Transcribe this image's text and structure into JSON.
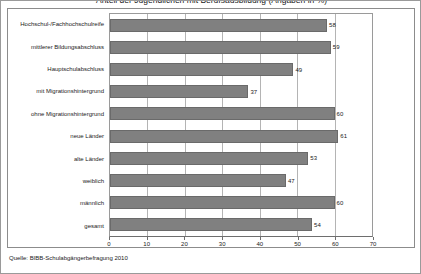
{
  "title": "Anteil der Jugendlichen mit Berufsausbildung (Angaben in %)",
  "source_note": "Quelle: BIBB-Schulabgängerbefragung 2010",
  "colors": {
    "bar_fill": "#808080",
    "bar_border": "#6a6a6a",
    "gridline": "#b4b4b4",
    "frame": "#8c8c8c",
    "background": "#ffffff",
    "text": "#1a1a1a"
  },
  "chart_data": {
    "type": "bar",
    "orientation": "horizontal",
    "title": "Anteil der Jugendlichen mit Berufsausbildung (Angaben in %)",
    "xlabel": "",
    "ylabel": "",
    "xlim": [
      0,
      70
    ],
    "grid": true,
    "legend": false,
    "xticks": [
      0,
      10,
      20,
      30,
      40,
      50,
      60,
      70
    ],
    "xtick_labels": [
      "0",
      "10",
      "20",
      "30",
      "40",
      "50",
      "60",
      "70"
    ],
    "categories": [
      "Hochschul-/Fachhochschulreife",
      "mittlerer Bildungsabschluss",
      "Hauptschulabschluss",
      "mit Migrationshintergrund",
      "ohne Migrationshintergrund",
      "neue Länder",
      "alte Länder",
      "weiblich",
      "männlich",
      "gesamt"
    ],
    "values": [
      58,
      59,
      49,
      37,
      60,
      61,
      53,
      47,
      60,
      54
    ],
    "value_labels": [
      "58",
      "59",
      "49",
      "37",
      "60",
      "61",
      "53",
      "47",
      "60",
      "54"
    ]
  }
}
